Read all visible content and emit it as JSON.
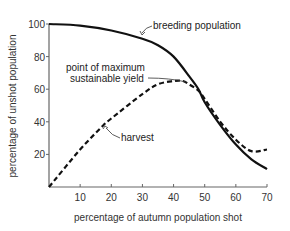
{
  "chart_data": {
    "type": "line",
    "title": "",
    "xlabel": "percentage of autumn population shot",
    "ylabel": "percentage of unshot population",
    "xlim": [
      0,
      70
    ],
    "ylim": [
      0,
      100
    ],
    "xticks": [
      10,
      20,
      30,
      40,
      50,
      60,
      70
    ],
    "yticks": [
      20,
      40,
      60,
      80,
      100
    ],
    "grid": false,
    "legend": "none (curves labelled by annotations)",
    "series": [
      {
        "name": "breeding population",
        "style": "solid",
        "color": "#111111",
        "x": [
          0,
          10,
          20,
          30,
          35,
          40,
          45,
          48,
          50,
          55,
          60,
          65,
          70
        ],
        "y": [
          100,
          99,
          96,
          91,
          87,
          80,
          68,
          60,
          52,
          38,
          26,
          17,
          11
        ]
      },
      {
        "name": "harvest",
        "style": "dashed",
        "color": "#111111",
        "x": [
          0,
          10,
          17,
          20,
          30,
          35,
          40,
          43,
          45,
          48,
          50,
          55,
          60,
          65,
          70
        ],
        "y": [
          0,
          23,
          37,
          42,
          57,
          63,
          65,
          65,
          63,
          59,
          54,
          40,
          29,
          22,
          23
        ]
      }
    ],
    "annotations": [
      {
        "text": "breeding population",
        "points_to": [
          31,
          90
        ]
      },
      {
        "text_lines": [
          "point of maximum",
          "sustainable yield"
        ],
        "points_to": [
          45,
          64
        ]
      },
      {
        "text": "harvest",
        "points_to": [
          17,
          37
        ]
      }
    ]
  },
  "labels": {
    "xlabel": "percentage of autumn population shot",
    "ylabel": "percentage of unshot population",
    "annot_breeding": "breeding population",
    "annot_msy_line1": "point of maximum",
    "annot_msy_line2": "sustainable yield",
    "annot_harvest": "harvest"
  }
}
